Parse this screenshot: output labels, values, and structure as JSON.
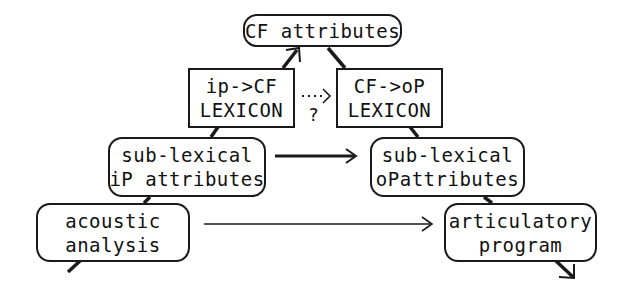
{
  "diagram": {
    "nodes": {
      "cf_attributes": {
        "lines": [
          "CF attributes"
        ]
      },
      "ip_cf_lexicon": {
        "lines": [
          "ip->CF",
          "LEXICON"
        ]
      },
      "cf_op_lexicon": {
        "lines": [
          "CF->oP",
          "LEXICON"
        ]
      },
      "sublexical_ip": {
        "lines": [
          "sub-lexical",
          "iP attributes"
        ]
      },
      "sublexical_op": {
        "lines": [
          "sub-lexical",
          "oPattributes"
        ]
      },
      "acoustic_analysis": {
        "lines": [
          "acoustic",
          "analysis"
        ]
      },
      "articulatory_program": {
        "lines": [
          "articulatory",
          "program"
        ]
      }
    },
    "dotted_link": {
      "arrow": "....>",
      "label": "?"
    },
    "edges": [
      {
        "from": "acoustic_analysis",
        "to": "articulatory_program",
        "style": "thin-arrow"
      },
      {
        "from": "sublexical_ip",
        "to": "sublexical_op",
        "style": "thick-arrow"
      },
      {
        "from": "ip_cf_lexicon",
        "to": "cf_op_lexicon",
        "style": "dotted-arrow",
        "label": "?"
      },
      {
        "from": "ip_cf_lexicon",
        "to": "cf_attributes",
        "style": "thick-arrow"
      },
      {
        "from": "cf_attributes",
        "to": "cf_op_lexicon",
        "style": "thick-line"
      },
      {
        "from": "sublexical_ip",
        "to": "ip_cf_lexicon",
        "style": "thick-line"
      },
      {
        "from": "cf_op_lexicon",
        "to": "sublexical_op",
        "style": "thick-line"
      },
      {
        "from": "acoustic_analysis",
        "to": "sublexical_ip",
        "style": "thick-line"
      },
      {
        "from": "sublexical_op",
        "to": "articulatory_program",
        "style": "thick-line"
      },
      {
        "from": "input",
        "to": "acoustic_analysis",
        "style": "thick-line"
      },
      {
        "from": "articulatory_program",
        "to": "output",
        "style": "thick-arrow"
      }
    ]
  }
}
